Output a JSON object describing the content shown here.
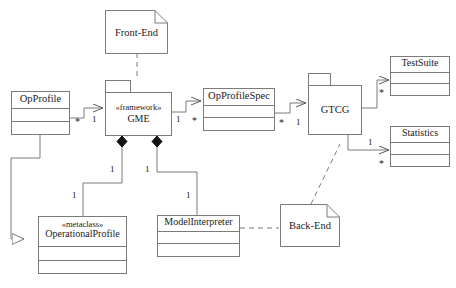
{
  "diagram": {
    "stroke_color": "#7b7b7b",
    "text_color": "#1a1a1a",
    "background": "#ffffff"
  },
  "nodes": {
    "front_end": {
      "label": "Front-End",
      "kind": "note"
    },
    "back_end": {
      "label": "Back-End",
      "kind": "note"
    },
    "gme": {
      "stereotype": "«framework»",
      "name": "GME",
      "kind": "package"
    },
    "gtcg": {
      "name": "GTCG",
      "kind": "package"
    },
    "op_profile": {
      "name": "OpProfile",
      "kind": "class"
    },
    "op_profile_spec": {
      "name": "OpProfileSpec",
      "kind": "class"
    },
    "test_suite": {
      "name": "TestSuite",
      "kind": "class"
    },
    "statistics": {
      "name": "Statistics",
      "kind": "class"
    },
    "operational_profile": {
      "stereotype": "«metaclass»",
      "name": "OperationalProfile",
      "kind": "class"
    },
    "model_interpreter": {
      "name": "ModelInterpreter",
      "kind": "class"
    }
  },
  "multiplicities": {
    "opprofile_to_gme_source": "*",
    "opprofile_to_gme_target": "1",
    "gme_to_spec_source": "1",
    "gme_to_spec_target": "*",
    "spec_to_gtcg_source": "*",
    "spec_to_gtcg_target": "1",
    "gtcg_to_testsuite": "*",
    "gtcg_to_statistics_source": "1",
    "gtcg_to_statistics_target": "*",
    "gme_comp_left_near": "1",
    "gme_comp_left_far": "1",
    "gme_comp_right_near": "1",
    "gme_comp_right_far": "1"
  }
}
